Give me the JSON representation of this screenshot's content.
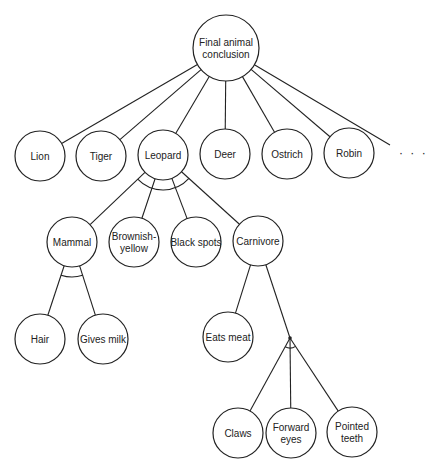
{
  "diagram": {
    "type": "and-or-tree",
    "root": {
      "id": "final",
      "label_lines": [
        "Final animal",
        "conclusion"
      ]
    },
    "nodes": [
      {
        "id": "final",
        "lines": [
          "Final animal",
          "conclusion"
        ],
        "x": 226,
        "y": 48,
        "r": 33
      },
      {
        "id": "lion",
        "lines": [
          "Lion"
        ],
        "x": 40,
        "y": 156,
        "r": 25
      },
      {
        "id": "tiger",
        "lines": [
          "Tiger"
        ],
        "x": 101,
        "y": 156,
        "r": 25
      },
      {
        "id": "leopard",
        "lines": [
          "Leopard"
        ],
        "x": 163,
        "y": 155,
        "r": 25
      },
      {
        "id": "deer",
        "lines": [
          "Deer"
        ],
        "x": 225,
        "y": 154,
        "r": 25
      },
      {
        "id": "ostrich",
        "lines": [
          "Ostrich"
        ],
        "x": 287,
        "y": 154,
        "r": 25
      },
      {
        "id": "robin",
        "lines": [
          "Robin"
        ],
        "x": 349,
        "y": 153,
        "r": 25
      },
      {
        "id": "mammal",
        "lines": [
          "Mammal"
        ],
        "x": 72,
        "y": 242,
        "r": 25
      },
      {
        "id": "brownish",
        "lines": [
          "Brownish-",
          "yellow"
        ],
        "x": 134,
        "y": 242,
        "r": 25
      },
      {
        "id": "blackspots",
        "lines": [
          "Black spots"
        ],
        "x": 196,
        "y": 242,
        "r": 25
      },
      {
        "id": "carnivore",
        "lines": [
          "Carnivore"
        ],
        "x": 258,
        "y": 241,
        "r": 25
      },
      {
        "id": "hair",
        "lines": [
          "Hair"
        ],
        "x": 40,
        "y": 339,
        "r": 25
      },
      {
        "id": "givesmilk",
        "lines": [
          "Gives milk"
        ],
        "x": 103,
        "y": 339,
        "r": 25
      },
      {
        "id": "eatsmeat",
        "lines": [
          "Eats meat"
        ],
        "x": 228,
        "y": 337,
        "r": 25
      },
      {
        "id": "claws",
        "lines": [
          "Claws"
        ],
        "x": 238,
        "y": 433,
        "r": 25
      },
      {
        "id": "forwardeyes",
        "lines": [
          "Forward",
          "eyes"
        ],
        "x": 291,
        "y": 433,
        "r": 25
      },
      {
        "id": "pointedteeth",
        "lines": [
          "Pointed",
          "teeth"
        ],
        "x": 352,
        "y": 432,
        "r": 25
      }
    ],
    "edges": [
      [
        "final",
        "lion"
      ],
      [
        "final",
        "tiger"
      ],
      [
        "final",
        "leopard"
      ],
      [
        "final",
        "deer"
      ],
      [
        "final",
        "ostrich"
      ],
      [
        "final",
        "robin"
      ],
      [
        "leopard",
        "mammal"
      ],
      [
        "leopard",
        "brownish"
      ],
      [
        "leopard",
        "blackspots"
      ],
      [
        "leopard",
        "carnivore"
      ],
      [
        "mammal",
        "hair"
      ],
      [
        "mammal",
        "givesmilk"
      ],
      [
        "carnivore",
        "eatsmeat"
      ],
      [
        "junction",
        "claws"
      ],
      [
        "junction",
        "forwardeyes"
      ],
      [
        "junction",
        "pointedteeth"
      ]
    ],
    "and_arcs": [
      {
        "parent": "leopard",
        "children": [
          "mammal",
          "brownish",
          "blackspots",
          "carnivore"
        ]
      },
      {
        "parent": "mammal",
        "children": [
          "hair",
          "givesmilk"
        ]
      },
      {
        "parent": "junction",
        "children": [
          "claws",
          "forwardeyes",
          "pointedteeth"
        ]
      }
    ],
    "junction": {
      "x": 290,
      "y": 338
    },
    "continuation": "· · ·",
    "extra_edge_to_more": true
  }
}
